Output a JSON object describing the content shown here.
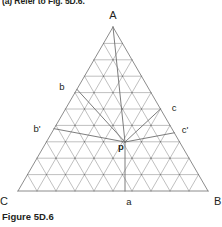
{
  "page": {
    "clipped_heading": "(a) Refer to Fig. 5D.6.",
    "caption": "Figure 5D.6"
  },
  "diagram": {
    "type": "ternary-grid-triangle",
    "vertices": [
      {
        "id": "A",
        "label": "A",
        "x": 113,
        "y": 27,
        "label_x": 113,
        "label_y": 19
      },
      {
        "id": "B",
        "label": "B",
        "x": 208,
        "y": 191,
        "label_x": 214,
        "label_y": 205
      },
      {
        "id": "C",
        "label": "C",
        "x": 18,
        "y": 191,
        "label_x": 8,
        "label_y": 205
      }
    ],
    "grid": {
      "divisions": 10,
      "line_color": "#8c8c8c",
      "line_width": 0.55
    },
    "outline": {
      "color": "#6e6e6e",
      "width": 0.8
    },
    "construction": {
      "color": "#6e6e6e",
      "width": 0.9
    },
    "edge_labels": [
      {
        "id": "b",
        "label": "b",
        "x": 62,
        "y": 90,
        "edge": "left"
      },
      {
        "id": "b-prime",
        "label": "b'",
        "x": 37,
        "y": 132,
        "edge": "left"
      },
      {
        "id": "c",
        "label": "c",
        "x": 174,
        "y": 111,
        "edge": "right"
      },
      {
        "id": "c-prime",
        "label": "c'",
        "x": 185,
        "y": 133,
        "edge": "right"
      },
      {
        "id": "a",
        "label": "a",
        "x": 129,
        "y": 205,
        "edge": "bottom"
      }
    ],
    "interior_point": {
      "id": "p",
      "label": "p",
      "x": 125,
      "y": 142,
      "label_x": 121,
      "label_y": 150
    }
  },
  "colors": {
    "grid": "#8c8c8c",
    "outline": "#6e6e6e",
    "construction": "#6e6e6e",
    "text": "#231f20",
    "background": "#ffffff"
  }
}
